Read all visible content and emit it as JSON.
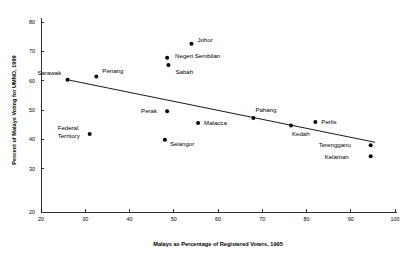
{
  "chart_data": {
    "type": "scatter",
    "title": "",
    "xlabel": "Malays as Percentage of Registered Voters, 1995",
    "ylabel": "Percent of Malays Voting for UMNO, 1999",
    "xlim": [
      20,
      100
    ],
    "ylim": [
      20,
      80
    ],
    "xticks": [
      20,
      30,
      40,
      50,
      60,
      70,
      80,
      90,
      100
    ],
    "yticks": [
      20,
      30,
      40,
      50,
      60,
      70,
      80
    ],
    "xtick_labels": [
      "20",
      "30",
      "40",
      "50",
      "60",
      "70",
      "80",
      "90",
      "100"
    ],
    "ytick_labels": [
      "20",
      "30",
      "40",
      "50",
      "60",
      "70",
      "80"
    ],
    "grid": false,
    "legend": "none",
    "marker_color": "#000000",
    "line_color": "#000000",
    "points": [
      {
        "name": "Sarawak",
        "x": 26.0,
        "y": 60.3,
        "label_dx": -30,
        "label_dy": -5,
        "label_anchor": "start"
      },
      {
        "name": "Penang",
        "x": 32.5,
        "y": 61.4,
        "label_dx": 6,
        "label_dy": -4,
        "label_anchor": "start"
      },
      {
        "name": "Federal Territory",
        "x": 31.0,
        "y": 41.8,
        "label_dx": -32,
        "label_dy": -4,
        "label_anchor": "start",
        "two_line": true,
        "line1": "Federal",
        "line2": "Territory"
      },
      {
        "name": "Perak",
        "x": 48.5,
        "y": 49.6,
        "label_dx": -26,
        "label_dy": 2,
        "label_anchor": "start"
      },
      {
        "name": "Selangor",
        "x": 48.0,
        "y": 39.9,
        "label_dx": 5,
        "label_dy": 6,
        "label_anchor": "start"
      },
      {
        "name": "Negeri Sembilan",
        "x": 48.5,
        "y": 67.8,
        "label_dx": 8,
        "label_dy": 0,
        "label_anchor": "start"
      },
      {
        "name": "Sabah",
        "x": 48.8,
        "y": 65.3,
        "label_dx": 7,
        "label_dy": 9,
        "label_anchor": "start"
      },
      {
        "name": "Johor",
        "x": 54.0,
        "y": 72.6,
        "label_dx": 6,
        "label_dy": -2,
        "label_anchor": "start"
      },
      {
        "name": "Malacca",
        "x": 55.5,
        "y": 45.6,
        "label_dx": 6,
        "label_dy": 2,
        "label_anchor": "start"
      },
      {
        "name": "Pahang",
        "x": 68.0,
        "y": 47.3,
        "label_dx": 2,
        "label_dy": -6,
        "label_anchor": "start"
      },
      {
        "name": "Kedah",
        "x": 76.5,
        "y": 44.7,
        "label_dx": 1,
        "label_dy": 10,
        "label_anchor": "start"
      },
      {
        "name": "Perlis",
        "x": 82.0,
        "y": 45.9,
        "label_dx": 6,
        "label_dy": 2,
        "label_anchor": "start"
      },
      {
        "name": "Terengganu",
        "x": 94.5,
        "y": 38.0,
        "label_dx": -52,
        "label_dy": 2,
        "label_anchor": "start"
      },
      {
        "name": "Kelantan",
        "x": 94.5,
        "y": 34.2,
        "label_dx": -46,
        "label_dy": 3,
        "label_anchor": "start"
      }
    ],
    "trend_line": {
      "x_start": 26.0,
      "y_start": 60.3,
      "x_end": 95.5,
      "y_end": 39.0
    }
  }
}
